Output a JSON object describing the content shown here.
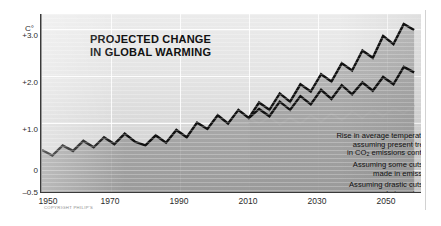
{
  "chart_data": {
    "type": "line",
    "title": "PROJECTED CHANGE IN GLOBAL WARMING",
    "title_lines": [
      "PROJECTED CHANGE",
      "IN GLOBAL WARMING"
    ],
    "xlabel": "",
    "ylabel": "C°",
    "y_unit": "C°",
    "xlim": [
      1950,
      2060
    ],
    "ylim": [
      -0.5,
      3.4
    ],
    "ytick_labels": [
      "+3.0",
      "+2.0",
      "+1.0",
      "0",
      "–0.5"
    ],
    "ytick_values": [
      3.0,
      2.0,
      1.0,
      0.0,
      -0.5
    ],
    "xtick_labels": [
      "1950",
      "1970",
      "1990",
      "2010",
      "2030",
      "2050"
    ],
    "xtick_values": [
      1950,
      1970,
      1990,
      2010,
      2030,
      2050
    ],
    "grid": true,
    "legend_position": "inside-lower-right",
    "copyright": "COPYRIGHT PHILIP'S",
    "series": [
      {
        "name": "high",
        "label_lines": [
          "Rise in average temperatures",
          "assuming present trends",
          "in CO2 emissions continue"
        ],
        "color": "#111111",
        "x": [
          1950,
          1953,
          1956,
          1959,
          1962,
          1965,
          1968,
          1971,
          1974,
          1977,
          1980,
          1983,
          1986,
          1989,
          1992,
          1995,
          1998,
          2001,
          2004,
          2007,
          2010,
          2013,
          2016,
          2019,
          2022,
          2025,
          2028,
          2031,
          2034,
          2037,
          2040,
          2043,
          2046,
          2049,
          2052,
          2055,
          2058
        ],
        "y": [
          0.42,
          0.3,
          0.52,
          0.4,
          0.62,
          0.48,
          0.7,
          0.55,
          0.78,
          0.6,
          0.52,
          0.74,
          0.58,
          0.86,
          0.7,
          1.02,
          0.88,
          1.18,
          1.0,
          1.3,
          1.12,
          1.46,
          1.3,
          1.66,
          1.48,
          1.86,
          1.7,
          2.08,
          1.92,
          2.32,
          2.16,
          2.6,
          2.44,
          2.92,
          2.74,
          3.18,
          3.05
        ]
      },
      {
        "name": "medium",
        "label_lines": [
          "Assuming some cuts are",
          "made in emissions"
        ],
        "color": "#111111",
        "x": [
          2010,
          2013,
          2016,
          2019,
          2022,
          2025,
          2028,
          2031,
          2034,
          2037,
          2040,
          2043,
          2046,
          2049,
          2052,
          2055,
          2058
        ],
        "y": [
          1.12,
          1.32,
          1.16,
          1.48,
          1.3,
          1.6,
          1.42,
          1.74,
          1.54,
          1.84,
          1.64,
          1.9,
          1.72,
          2.02,
          1.86,
          2.24,
          2.12
        ]
      },
      {
        "name": "low",
        "label_lines": [
          "Assuming drastic cuts are",
          "made in emissions"
        ],
        "color": "#a9a9a9",
        "x": [
          2010,
          2013,
          2016,
          2019,
          2022,
          2025,
          2028,
          2031,
          2034,
          2037,
          2040,
          2043,
          2046,
          2049,
          2052,
          2055,
          2058
        ],
        "y": [
          1.12,
          1.0,
          1.14,
          0.98,
          1.12,
          1.0,
          1.18,
          1.04,
          1.22,
          1.08,
          1.26,
          1.12,
          1.3,
          1.16,
          1.34,
          1.22,
          1.4
        ]
      }
    ]
  },
  "legend": {
    "items": [
      {
        "name": "legend-high",
        "lines": [
          "Rise in average temperatures",
          "assuming present trends",
          "in CO",
          "2",
          " emissions continue"
        ],
        "line1": "Rise in average temperatures",
        "line2": "assuming present trends",
        "line3_pre": "in CO",
        "line3_sub": "2",
        "line3_post": " emissions continue",
        "swatch": "zigzag-dark"
      },
      {
        "name": "legend-medium",
        "line1": "Assuming some cuts are",
        "line2": "made in emissions",
        "swatch": "zigzag-dark"
      },
      {
        "name": "legend-low",
        "line1": "Assuming drastic cuts are",
        "line2": "made in emissions",
        "swatch": "zigzag-light"
      }
    ]
  },
  "colors": {
    "line_dark": "#111111",
    "line_light": "#a9a9a9",
    "panel_light": "#ebebeb",
    "panel_dark": "#cfcfcf",
    "grid": "#ffffff",
    "axis": "#3a3a3a",
    "text": "#1a1a1a",
    "page": "#ffffff"
  }
}
